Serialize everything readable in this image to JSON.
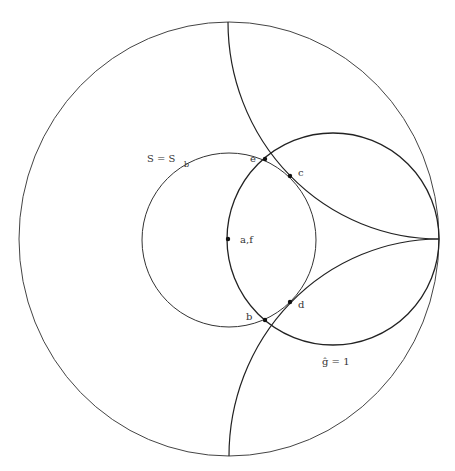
{
  "diagram": {
    "colors": {
      "stroke": "#333333",
      "background": "#ffffff"
    },
    "labels": {
      "S_eq": "S = S",
      "S_sub": "b",
      "g_hat": "ĝ = 1",
      "af": "a,f",
      "e": "e",
      "c": "c",
      "d": "d",
      "b": "b"
    },
    "points": [
      {
        "name": "a,f",
        "x": 228,
        "y": 239
      },
      {
        "name": "e",
        "x": 265,
        "y": 159
      },
      {
        "name": "c",
        "x": 290,
        "y": 176
      },
      {
        "name": "d",
        "x": 290,
        "y": 302
      },
      {
        "name": "b",
        "x": 265,
        "y": 320
      }
    ]
  }
}
